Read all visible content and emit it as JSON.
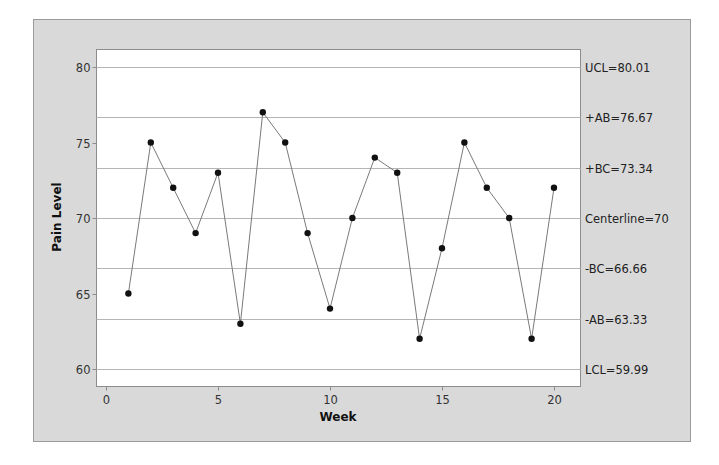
{
  "chart_data": {
    "type": "line",
    "title": "",
    "xlabel": "Week",
    "ylabel": "Pain Level",
    "xlim": [
      -0.5,
      21.1
    ],
    "ylim": [
      58.8,
      81.2
    ],
    "x_ticks": [
      0,
      5,
      10,
      15,
      20
    ],
    "y_ticks": [
      60,
      65,
      70,
      75,
      80
    ],
    "grid": false,
    "legend": "none",
    "series": [
      {
        "name": "Pain Level",
        "x": [
          1,
          2,
          3,
          4,
          5,
          6,
          7,
          8,
          9,
          10,
          11,
          12,
          13,
          14,
          15,
          16,
          17,
          18,
          19,
          20
        ],
        "values": [
          65,
          75,
          72,
          69,
          73,
          63,
          77,
          75,
          69,
          64,
          70,
          74,
          73,
          62,
          68,
          75,
          72,
          70,
          62,
          72
        ],
        "marker": "circle",
        "color": "#111111",
        "line_color": "#7a7a7a"
      }
    ],
    "reference_lines": [
      {
        "name": "UCL",
        "value": 80.01,
        "label": "UCL=80.01"
      },
      {
        "name": "+AB",
        "value": 76.67,
        "label": "+AB=76.67"
      },
      {
        "name": "+BC",
        "value": 73.34,
        "label": "+BC=73.34"
      },
      {
        "name": "Centerline",
        "value": 70,
        "label": "Centerline=70"
      },
      {
        "name": "-BC",
        "value": 66.66,
        "label": "-BC=66.66"
      },
      {
        "name": "-AB",
        "value": 63.33,
        "label": "-AB=63.33"
      },
      {
        "name": "LCL",
        "value": 59.99,
        "label": "LCL=59.99"
      }
    ]
  },
  "colors": {
    "frame_background": "#d9d9d9",
    "frame_border": "#9a9a9a",
    "plot_background": "#ffffff",
    "plot_border": "#8c8c8c",
    "reference_line": "#b5b5b5",
    "data_line": "#7a7a7a",
    "marker": "#111111"
  }
}
